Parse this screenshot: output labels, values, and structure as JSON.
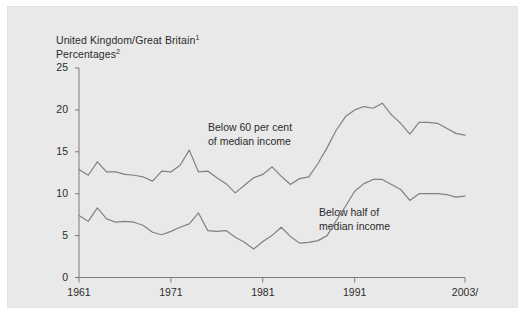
{
  "panel": {
    "background_color": "#e9e9e9",
    "outer_background_color": "#ffffff"
  },
  "title": {
    "line1": "United Kingdom/Great Britain",
    "line1_superscript": "1",
    "line2": "Percentages",
    "line2_superscript": "2"
  },
  "annotations": {
    "upper_line1": "Below 60 per cent",
    "upper_line2": "of median income",
    "lower_line1": "Below half of",
    "lower_line2": "median income"
  },
  "axis": {
    "y_ticks": [
      "0",
      "5",
      "10",
      "15",
      "20",
      "25"
    ],
    "x_ticks": [
      "1961",
      "1971",
      "1981",
      "1991",
      "2003/"
    ],
    "line_color": "#7a7a7a"
  },
  "chart_data": {
    "type": "line",
    "title": "United Kingdom/Great Britain",
    "subtitle": "Percentages",
    "xlabel": "",
    "ylabel": "",
    "xlim": [
      1961,
      2003
    ],
    "ylim": [
      0,
      25
    ],
    "grid": false,
    "legend": "inline-annotations",
    "x": [
      1961,
      1962,
      1963,
      1964,
      1965,
      1966,
      1967,
      1968,
      1969,
      1970,
      1971,
      1972,
      1973,
      1974,
      1975,
      1976,
      1977,
      1978,
      1979,
      1980,
      1981,
      1982,
      1983,
      1984,
      1985,
      1986,
      1987,
      1988,
      1989,
      1990,
      1991,
      1992,
      1993,
      1994,
      1995,
      1996,
      1997,
      1998,
      1999,
      2000,
      2001,
      2002,
      2003
    ],
    "series": [
      {
        "name": "Below 60 per cent of median income",
        "color": "#808080",
        "values": [
          12.9,
          12.2,
          13.8,
          12.6,
          12.6,
          12.3,
          12.2,
          12.0,
          11.5,
          12.7,
          12.6,
          13.4,
          15.2,
          12.6,
          12.7,
          11.9,
          11.2,
          10.1,
          11.0,
          11.9,
          12.3,
          13.2,
          12.1,
          11.1,
          11.8,
          12.0,
          13.6,
          15.5,
          17.6,
          19.2,
          20.0,
          20.4,
          20.2,
          20.8,
          19.4,
          18.4,
          17.1,
          18.5,
          18.5,
          18.4,
          17.8,
          17.2,
          17.0
        ]
      },
      {
        "name": "Below half of median income",
        "color": "#808080",
        "values": [
          7.4,
          6.7,
          8.3,
          7.0,
          6.6,
          6.7,
          6.6,
          6.2,
          5.4,
          5.1,
          5.5,
          6.0,
          6.4,
          7.7,
          5.6,
          5.5,
          5.6,
          4.8,
          4.2,
          3.4,
          4.3,
          5.0,
          6.0,
          4.9,
          4.1,
          4.2,
          4.4,
          5.0,
          6.8,
          8.5,
          10.3,
          11.2,
          11.7,
          11.7,
          11.1,
          10.5,
          9.2,
          10.0,
          10.0,
          10.0,
          9.9,
          9.6,
          9.7
        ]
      }
    ]
  }
}
